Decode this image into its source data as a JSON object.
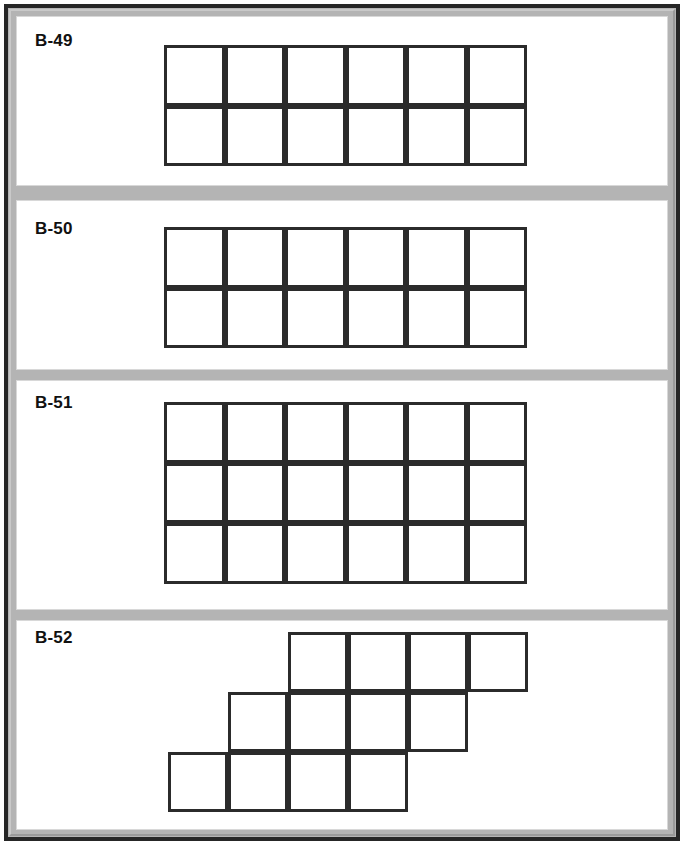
{
  "page": {
    "width": 684,
    "height": 845,
    "frame_color": "#262626",
    "band_color": "#b4b4b4",
    "panel_color": "#ffffff",
    "line_color": "#2b2b2b",
    "label_color": "#111111"
  },
  "panels": [
    {
      "id": "b-49",
      "label": "B-49",
      "label_top": 30,
      "panel": {
        "left": 16,
        "top": 16,
        "width": 652,
        "height": 170
      },
      "figure": {
        "type": "rectangular-grid",
        "left": 163,
        "top": 44,
        "cell": 60.5,
        "rows": 2,
        "cols": 6,
        "cells": [
          [
            0,
            0
          ],
          [
            1,
            0
          ],
          [
            2,
            0
          ],
          [
            3,
            0
          ],
          [
            4,
            0
          ],
          [
            5,
            0
          ],
          [
            0,
            1
          ],
          [
            1,
            1
          ],
          [
            2,
            1
          ],
          [
            3,
            1
          ],
          [
            4,
            1
          ],
          [
            5,
            1
          ]
        ],
        "cell_count": 12
      }
    },
    {
      "id": "b-50",
      "label": "B-50",
      "label_top": 218,
      "panel": {
        "left": 16,
        "top": 200,
        "width": 652,
        "height": 170
      },
      "figure": {
        "type": "rectangular-grid",
        "left": 163,
        "top": 226,
        "cell": 60.5,
        "rows": 2,
        "cols": 6,
        "cells": [
          [
            0,
            0
          ],
          [
            1,
            0
          ],
          [
            2,
            0
          ],
          [
            3,
            0
          ],
          [
            4,
            0
          ],
          [
            5,
            0
          ],
          [
            0,
            1
          ],
          [
            1,
            1
          ],
          [
            2,
            1
          ],
          [
            3,
            1
          ],
          [
            4,
            1
          ],
          [
            5,
            1
          ]
        ],
        "cell_count": 12
      }
    },
    {
      "id": "b-51",
      "label": "B-51",
      "label_top": 392,
      "panel": {
        "left": 16,
        "top": 380,
        "width": 652,
        "height": 230
      },
      "figure": {
        "type": "rectangular-grid",
        "left": 163,
        "top": 401,
        "cell": 60.5,
        "rows": 3,
        "cols": 6,
        "cells": [
          [
            0,
            0
          ],
          [
            1,
            0
          ],
          [
            2,
            0
          ],
          [
            3,
            0
          ],
          [
            4,
            0
          ],
          [
            5,
            0
          ],
          [
            0,
            1
          ],
          [
            1,
            1
          ],
          [
            2,
            1
          ],
          [
            3,
            1
          ],
          [
            4,
            1
          ],
          [
            5,
            1
          ],
          [
            0,
            2
          ],
          [
            1,
            2
          ],
          [
            2,
            2
          ],
          [
            3,
            2
          ],
          [
            4,
            2
          ],
          [
            5,
            2
          ]
        ],
        "cell_count": 18
      }
    },
    {
      "id": "b-52",
      "label": "B-52",
      "label_top": 627,
      "panel": {
        "left": 16,
        "top": 620,
        "width": 652,
        "height": 210
      },
      "figure": {
        "type": "staircase-grid",
        "left": 167,
        "top": 631,
        "cell": 60,
        "rows": 3,
        "cols": 7,
        "cells": [
          [
            2,
            0
          ],
          [
            3,
            0
          ],
          [
            4,
            0
          ],
          [
            5,
            0
          ],
          [
            1,
            1
          ],
          [
            2,
            1
          ],
          [
            3,
            1
          ],
          [
            4,
            1
          ],
          [
            0,
            2
          ],
          [
            1,
            2
          ],
          [
            2,
            2
          ],
          [
            3,
            2
          ]
        ],
        "cell_count": 12
      }
    }
  ]
}
